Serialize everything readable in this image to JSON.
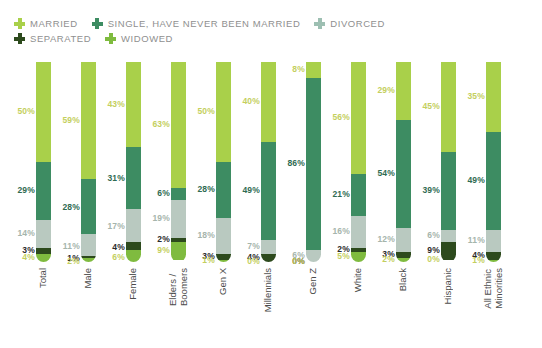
{
  "title": "MARGINALIZED PRACTICING CHRISTIANS",
  "title_color": "#9a9b2e",
  "legend": {
    "rows": [
      [
        {
          "label": "MARRIED",
          "color": "#a9d04a",
          "icon": "plus-icon"
        },
        {
          "label": "SINGLE, HAVE NEVER BEEN MARRIED",
          "color": "#3d8c62",
          "icon": "plus-icon"
        },
        {
          "label": "DIVORCED",
          "color": "#9dbfb2",
          "icon": "plus-icon"
        }
      ],
      [
        {
          "label": "SEPARATED",
          "color": "#2d4a1d",
          "icon": "plus-icon"
        },
        {
          "label": "WIDOWED",
          "color": "#7fbb3f",
          "icon": "plus-icon"
        }
      ]
    ]
  },
  "chart_data": {
    "type": "bar",
    "stacked": true,
    "title": "MARGINALIZED PRACTICING CHRISTIANS",
    "xlabel": "",
    "ylabel": "",
    "ylim": [
      0,
      100
    ],
    "grid": false,
    "legend_position": "top",
    "value_suffix": "%",
    "categories": [
      "Total",
      "Male",
      "Female",
      "Elders /\nBoomers",
      "Gen X",
      "Millennials",
      "Gen Z",
      "White",
      "Black",
      "Hispanic",
      "All Ethnic\nMinorities"
    ],
    "series": [
      {
        "name": "MARRIED",
        "color": "#a9d04a",
        "label_color": "#c4cf5e",
        "values": [
          50,
          59,
          43,
          63,
          50,
          40,
          8,
          56,
          29,
          45,
          35
        ]
      },
      {
        "name": "SINGLE, HAVE NEVER BEEN MARRIED",
        "color": "#3d8c62",
        "label_color": "#2f6b52",
        "values": [
          29,
          28,
          31,
          6,
          28,
          49,
          86,
          21,
          54,
          39,
          49
        ]
      },
      {
        "name": "DIVORCED",
        "color": "#b9c9c0",
        "label_color": "#a6b5ac",
        "values": [
          14,
          11,
          17,
          19,
          18,
          7,
          6,
          16,
          12,
          6,
          11
        ]
      },
      {
        "name": "SEPARATED",
        "color": "#2d4a1d",
        "label_color": "#2b2b2b",
        "values": [
          3,
          1,
          4,
          2,
          3,
          4,
          0,
          2,
          3,
          9,
          4
        ]
      },
      {
        "name": "WIDOWED",
        "color": "#7fbb3f",
        "label_color": "#c4cf5e",
        "values": [
          4,
          2,
          6,
          9,
          1,
          0,
          0,
          5,
          2,
          0,
          1
        ]
      }
    ]
  }
}
